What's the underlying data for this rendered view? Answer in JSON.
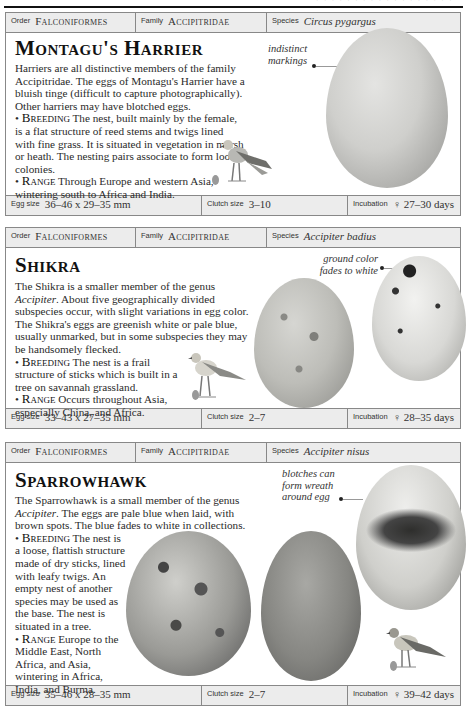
{
  "page": {
    "running_header_fragment": "· · · · · · · · · · · · · · · · · ·"
  },
  "labels": {
    "order": "Order",
    "family": "Family",
    "species": "Species",
    "egg_size": "Egg size",
    "clutch_size": "Clutch size",
    "incubation": "Incubation"
  },
  "entries": [
    {
      "order": "Falconiformes",
      "family": "Accipitridae",
      "species": "Circus pygargus",
      "title": "Montagu's Harrier",
      "intro": "Harriers are all distinctive members of the family Accipitridae. The eggs of Montagu's Harrier have a bluish tinge (difficult to capture photographically). Other harriers may have blotched eggs.",
      "breeding_label": "Breeding",
      "breeding": "The nest, built mainly by the female, is a flat structure of reed stems and twigs lined with fine grass. It is situated in vegetation in marsh or heath. The nesting pairs associate to form loose colonies.",
      "range_label": "Range",
      "range": "Through Europe and western Asia, wintering south to Africa and India.",
      "annotation": "indistinct markings",
      "egg_size": "36–46 x 29–35 mm",
      "clutch_size": "3–10",
      "incubation": "♀ 27–30 days"
    },
    {
      "order": "Falconiformes",
      "family": "Accipitridae",
      "species": "Accipiter badius",
      "title": "Shikra",
      "intro_pre": "The Shikra is a smaller member of the genus ",
      "intro_genus": "Accipiter",
      "intro_post": ". About five geographically divided subspecies occur, with slight variations in egg color. The Shikra's eggs are greenish white or pale blue, usually unmarked, but in some subspecies they may be handsomely flecked.",
      "breeding_label": "Breeding",
      "breeding": "The nest is a frail structure of sticks which is built in a tree on savannah grassland.",
      "range_label": "Range",
      "range": "Occurs throughout Asia, especially China, and Africa.",
      "annotation": "ground color fades to white",
      "egg_size": "33–43 x 27–35 mm",
      "clutch_size": "2–7",
      "incubation": "♀ 28–35 days"
    },
    {
      "order": "Falconiformes",
      "family": "Accipitridae",
      "species": "Accipiter nisus",
      "title": "Sparrowhawk",
      "intro_pre": "The Sparrowhawk is a small member of the genus ",
      "intro_genus": "Accipiter",
      "intro_post": ". The eggs are pale blue when laid, with brown spots. The blue fades to white in collections.",
      "breeding_label": "Breeding",
      "breeding": "The nest is a loose, flattish structure made of dry sticks, lined with leafy twigs. An empty nest of another species may be used as the base. The nest is situated in a tree.",
      "range_label": "Range",
      "range": "Europe to the Middle East, North Africa, and Asia, wintering in Africa, India, and Burma.",
      "annotation": "blotches can form wreath around egg",
      "egg_size": "35–46 x 28–35 mm",
      "clutch_size": "2–7",
      "incubation": "♀ 39–42 days"
    }
  ]
}
